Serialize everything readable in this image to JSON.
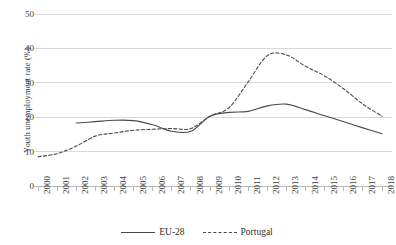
{
  "chart_data": {
    "type": "line",
    "title": "",
    "xlabel": "",
    "ylabel": "Youth unemployment rate (%)",
    "x": [
      2000,
      2001,
      2002,
      2003,
      2004,
      2005,
      2006,
      2007,
      2008,
      2009,
      2010,
      2011,
      2012,
      2013,
      2014,
      2015,
      2016,
      2017,
      2018
    ],
    "xtick_labels": [
      "2000",
      "2001",
      "2002",
      "2003",
      "2004",
      "2005",
      "2006",
      "2007",
      "2008",
      "2009",
      "2010",
      "2011",
      "2012",
      "2013",
      "2014",
      "2015",
      "2016",
      "2017",
      "2018"
    ],
    "ytick_labels": [
      "0",
      "10",
      "20",
      "30",
      "40",
      "50"
    ],
    "yticks": [
      0,
      10,
      20,
      30,
      40,
      50
    ],
    "ylim": [
      0,
      50
    ],
    "xlim": [
      2000,
      2018
    ],
    "grid": "horizontal",
    "legend_position": "bottom",
    "series": [
      {
        "name": "EU-28",
        "style": "solid",
        "color": "#4a4a4a",
        "x": [
          2002,
          2003,
          2004,
          2005,
          2006,
          2007,
          2008,
          2009,
          2010,
          2011,
          2012,
          2013,
          2014,
          2015,
          2016,
          2017,
          2018
        ],
        "values": [
          18.3,
          18.7,
          19.1,
          19.0,
          17.8,
          15.9,
          15.9,
          20.3,
          21.4,
          21.7,
          23.3,
          23.8,
          22.2,
          20.4,
          18.7,
          16.9,
          15.2
        ]
      },
      {
        "name": "Portugal",
        "style": "dashed",
        "color": "#4a4a4a",
        "x": [
          2000,
          2001,
          2002,
          2003,
          2004,
          2005,
          2006,
          2007,
          2008,
          2009,
          2010,
          2011,
          2012,
          2013,
          2014,
          2015,
          2016,
          2017,
          2018
        ],
        "values": [
          8.5,
          9.4,
          11.6,
          14.5,
          15.4,
          16.2,
          16.5,
          16.7,
          16.7,
          20.3,
          22.8,
          30.3,
          37.9,
          38.1,
          34.8,
          32.0,
          28.2,
          23.8,
          20.3
        ]
      }
    ]
  },
  "legend": {
    "items": [
      {
        "label": "EU-28",
        "style": "solid"
      },
      {
        "label": "Portugal",
        "style": "dashed"
      }
    ]
  }
}
